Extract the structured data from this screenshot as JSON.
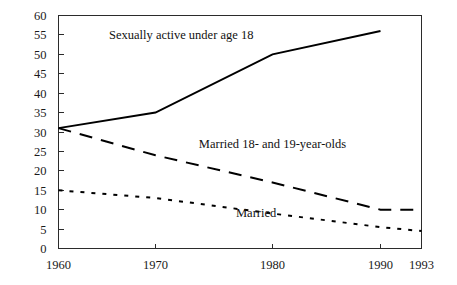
{
  "chart_data": {
    "type": "line",
    "title": "",
    "subtitle": "",
    "xlabel": "",
    "ylabel": "",
    "xlim": [
      1960,
      1993
    ],
    "ylim": [
      0,
      60
    ],
    "grid": false,
    "legend_position": "inline-annotations",
    "x_tick_labels": [
      "1960",
      "1970",
      "1980",
      "1990",
      "1993"
    ],
    "x_tick_values": [
      1960,
      1970,
      1980,
      1990,
      1993
    ],
    "y_tick_labels": [
      "0",
      "5",
      "10",
      "15",
      "20",
      "25",
      "30",
      "35",
      "40",
      "45",
      "50",
      "55",
      "60"
    ],
    "y_tick_values": [
      0,
      5,
      10,
      15,
      20,
      25,
      30,
      35,
      40,
      45,
      50,
      55,
      60
    ],
    "series": [
      {
        "name": "Sexually active under age 18",
        "style": "solid",
        "color": "#000000",
        "x": [
          1960,
          1970,
          1980,
          1990
        ],
        "values": [
          31,
          35,
          50,
          56
        ]
      },
      {
        "name": "Married 18- and 19-year-olds",
        "style": "dashed",
        "color": "#000000",
        "x": [
          1960,
          1970,
          1980,
          1990,
          1993
        ],
        "values": [
          31,
          24,
          17,
          10,
          10
        ]
      },
      {
        "name": "Married",
        "style": "dotted",
        "color": "#000000",
        "x": [
          1960,
          1970,
          1980,
          1990,
          1993
        ],
        "values": [
          15,
          13,
          9,
          5.5,
          4.5
        ]
      }
    ],
    "annotations": [
      {
        "text": "Sexually active under age 18",
        "x": 1972.2,
        "y": 55.0
      },
      {
        "text": "Married 18- and 19-year-olds",
        "x": 1980.0,
        "y": 27.0
      },
      {
        "text": "Married",
        "x": 1978.6,
        "y": 9.2
      }
    ]
  },
  "colors": {
    "axis": "#2b2b2b",
    "ink": "#111111",
    "background": "#ffffff"
  }
}
